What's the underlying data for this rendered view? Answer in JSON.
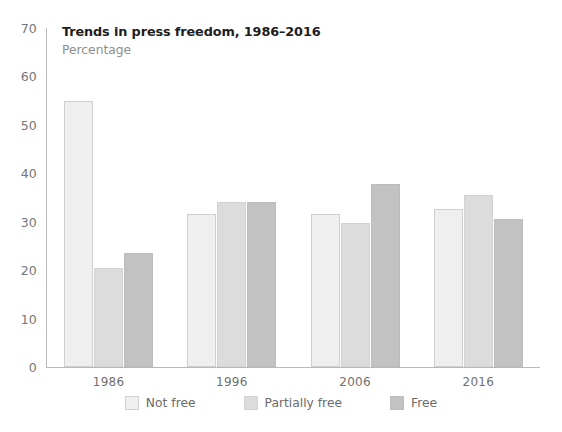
{
  "chart_data": {
    "type": "bar",
    "title": "Trends in press freedom, 1986–2016",
    "subtitle": "Percentage",
    "xlabel": "",
    "ylabel": "",
    "categories": [
      "1986",
      "1996",
      "2006",
      "2016"
    ],
    "series": [
      {
        "name": "Not free",
        "color": "#efefef",
        "values": [
          55.0,
          31.5,
          31.5,
          32.6
        ]
      },
      {
        "name": "Partially free",
        "color": "#dcdcdc",
        "values": [
          20.5,
          34.0,
          29.8,
          35.6
        ]
      },
      {
        "name": "Free",
        "color": "#c2c2c2",
        "values": [
          23.5,
          34.0,
          37.8,
          30.5
        ]
      }
    ],
    "ylim": [
      0,
      70
    ],
    "yticks": [
      0,
      10,
      20,
      30,
      40,
      50,
      60,
      70
    ],
    "ytick_labels": [
      "0",
      "10",
      "20",
      "30",
      "40",
      "50",
      "60",
      "70"
    ],
    "grid": false,
    "legend_position": "bottom"
  },
  "axis": {
    "line_color": "#b9b9b9",
    "tick_text_color": "#767676"
  }
}
